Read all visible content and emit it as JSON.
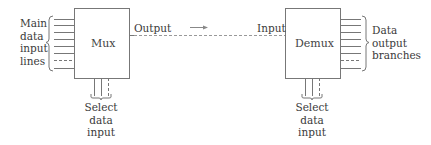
{
  "diagram": {
    "mux": {
      "label": "Mux"
    },
    "demux": {
      "label": "Demux"
    },
    "left_group_label": [
      "Main",
      "data",
      "input",
      "lines"
    ],
    "right_group_label": [
      "Data",
      "output",
      "branches"
    ],
    "output_label": "Output",
    "input_label": "Input",
    "mux_select_label": [
      "Select",
      "data",
      "input"
    ],
    "demux_select_label": [
      "Select",
      "data",
      "input"
    ],
    "colors": {
      "line": "#6a6a6a",
      "text": "#3a3a3a"
    }
  }
}
